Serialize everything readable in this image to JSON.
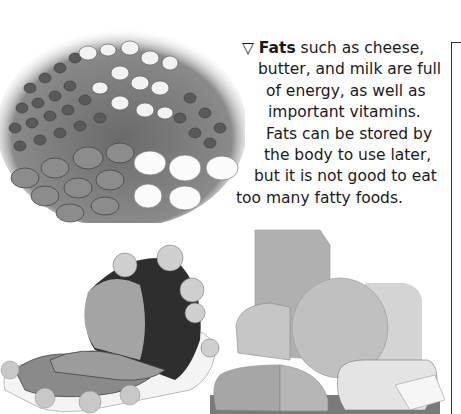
{
  "caption": {
    "marker_icon": "▽",
    "bold_term": "Fats",
    "lines": [
      " such as cheese,",
      "butter, and milk are full",
      "of energy, as well as",
      "important vitamins.",
      "Fats can be stored by",
      "the body to use later,",
      "but it is not good to eat",
      "too many fatty foods."
    ]
  },
  "images": {
    "beans": "photo of assorted dried beans",
    "ham": "photo of roast ham on a platter",
    "cheese": "photo of assorted cheeses"
  }
}
